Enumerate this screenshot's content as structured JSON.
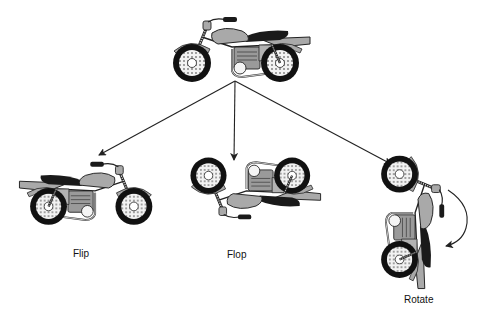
{
  "diagram": {
    "type": "transformation-diagram",
    "colors": {
      "line": "#222222",
      "tire": "#111111",
      "body_fill": "#a9a9a9",
      "seat": "#1a1a1a",
      "spoke_fill": "#e8e8e8",
      "background": "#ffffff"
    },
    "source": {
      "name": "original-motorcycle",
      "orientation": "facing-left"
    },
    "transforms": [
      {
        "id": "flip",
        "label": "Flip",
        "description": "mirrored horizontally"
      },
      {
        "id": "flop",
        "label": "Flop",
        "description": "mirrored vertically"
      },
      {
        "id": "rotate",
        "label": "Rotate",
        "description": "rotated 90 degrees"
      }
    ],
    "arrows": [
      {
        "from": "original-motorcycle",
        "to": "flip"
      },
      {
        "from": "original-motorcycle",
        "to": "flop"
      },
      {
        "from": "original-motorcycle",
        "to": "rotate"
      }
    ]
  }
}
